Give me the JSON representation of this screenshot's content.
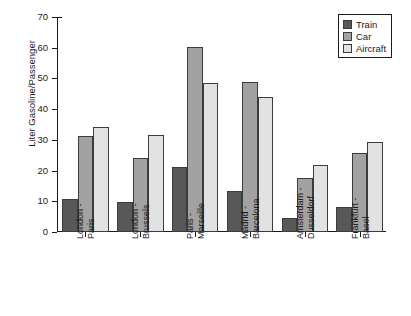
{
  "chart_data": {
    "type": "bar",
    "title": "",
    "xlabel": "",
    "ylabel": "Liter Gasoline/Passenger",
    "ylim": [
      0,
      70
    ],
    "yticks": [
      0,
      10,
      20,
      30,
      40,
      50,
      60,
      70
    ],
    "grid": false,
    "legend_position": "top-right",
    "categories": [
      "London -\nParis",
      "London -\nBrussels",
      "Paris -\nMarseille",
      "Madrid -\nBarcelona",
      "Amsterdam -\nDusseldorf",
      "Frankfurt -\nBasel"
    ],
    "category_lines": [
      [
        "London -",
        "Paris"
      ],
      [
        "London -",
        "Brussels"
      ],
      [
        "Paris -",
        "Marseille"
      ],
      [
        "Madrid -",
        "Barcelona"
      ],
      [
        "Amsterdam -",
        "Dusseldorf"
      ],
      [
        "Frankfurt -",
        "Basel"
      ]
    ],
    "series": [
      {
        "name": "Train",
        "color": "#585858",
        "values": [
          10.7,
          9.8,
          21.2,
          13.3,
          4.4,
          8.3
        ]
      },
      {
        "name": "Car",
        "color": "#a2a2a2",
        "values": [
          31.2,
          24.0,
          60.3,
          48.7,
          17.6,
          25.6
        ]
      },
      {
        "name": "Aircraft",
        "color": "#e2e2e2",
        "values": [
          34.1,
          31.5,
          48.4,
          44.1,
          21.8,
          29.2
        ]
      }
    ]
  },
  "legend": {
    "items": [
      {
        "label": "Train",
        "color": "#585858"
      },
      {
        "label": "Car",
        "color": "#a2a2a2"
      },
      {
        "label": "Aircraft",
        "color": "#e2e2e2"
      }
    ]
  },
  "axes": {
    "y_title": "Liter Gasoline/Passenger",
    "y_tick_labels": [
      "70",
      "60",
      "50",
      "40",
      "30",
      "20",
      "10",
      "0"
    ]
  }
}
